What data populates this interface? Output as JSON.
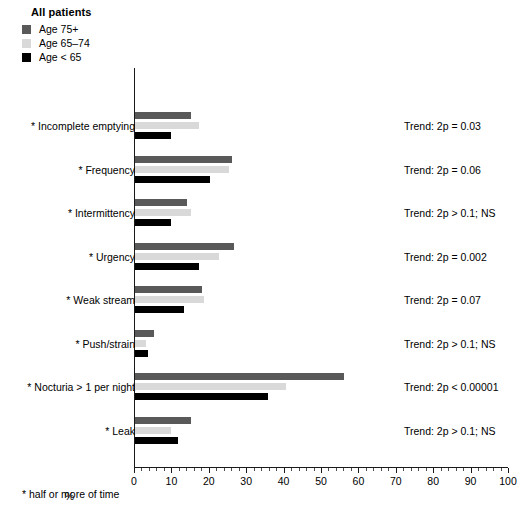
{
  "legend": {
    "title": "All patients",
    "items": [
      {
        "label": "Age 75+",
        "color": "#595959"
      },
      {
        "label": "Age 65–74",
        "color": "#d9d9d9"
      },
      {
        "label": "Age < 65",
        "color": "#000000"
      }
    ]
  },
  "footnote": "* half or more of time",
  "chart_data": {
    "type": "bar",
    "orientation": "horizontal",
    "title": "All patients",
    "xlabel": "%",
    "ylabel": "",
    "xlim": [
      0,
      100
    ],
    "xticks": [
      0,
      10,
      20,
      30,
      40,
      50,
      60,
      70,
      80,
      90,
      100
    ],
    "xtick_labels": [
      "0",
      "10",
      "20",
      "30",
      "40",
      "50",
      "60",
      "70",
      "80",
      "90",
      "100"
    ],
    "minor_tick_step": 2,
    "grid": false,
    "legend_position": "top-left",
    "categories": [
      "* Incomplete emptying",
      "* Frequency",
      "* Intermittency",
      "* Urgency",
      "* Weak stream",
      "* Push/strain",
      "* Nocturia > 1 per night",
      "* Leak"
    ],
    "series": [
      {
        "name": "Age 75+",
        "color": "#595959",
        "values": [
          15,
          26,
          14,
          26.5,
          18,
          5,
          56,
          15
        ]
      },
      {
        "name": "Age 65–74",
        "color": "#d9d9d9",
        "values": [
          17,
          25,
          15,
          22.5,
          18.5,
          3,
          40.5,
          9.5
        ]
      },
      {
        "name": "Age < 65",
        "color": "#000000",
        "values": [
          9.5,
          20,
          9.5,
          17,
          13,
          3.5,
          35.5,
          11.5
        ]
      }
    ],
    "annotations": [
      "Trend: 2p = 0.03",
      "Trend: 2p = 0.06",
      "Trend: 2p > 0.1; NS",
      "Trend: 2p = 0.002",
      "Trend: 2p = 0.07",
      "Trend: 2p > 0.1; NS",
      "Trend: 2p < 0.00001",
      "Trend: 2p > 0.1; NS"
    ],
    "footnote": "* half or more of time"
  }
}
